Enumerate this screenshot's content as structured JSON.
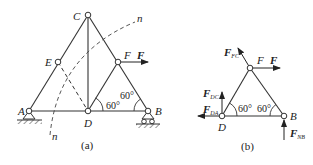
{
  "figure_a": {
    "caption": "(a)",
    "nodes": {
      "A": "A",
      "B": "B",
      "C": "C",
      "D": "D",
      "E": "E",
      "F": "F"
    },
    "force_label": "F",
    "section_label_top": "n",
    "section_label_bottom": "n",
    "angle_1": "60°",
    "angle_2": "60°"
  },
  "figure_b": {
    "caption": "(b)",
    "node_F": "F",
    "node_D": "D",
    "node_B": "B",
    "force_F": "F",
    "force_FC": {
      "main": "F",
      "sub": "FC"
    },
    "force_DC": {
      "main": "F",
      "sub": "DC"
    },
    "force_DA": {
      "main": "F",
      "sub": "DA"
    },
    "force_NB": {
      "main": "F",
      "sub": "NB"
    },
    "angle_1": "60°",
    "angle_2": "60°"
  },
  "colors": {
    "line": "#333333",
    "dash": "#444444",
    "background": "#ffffff"
  }
}
